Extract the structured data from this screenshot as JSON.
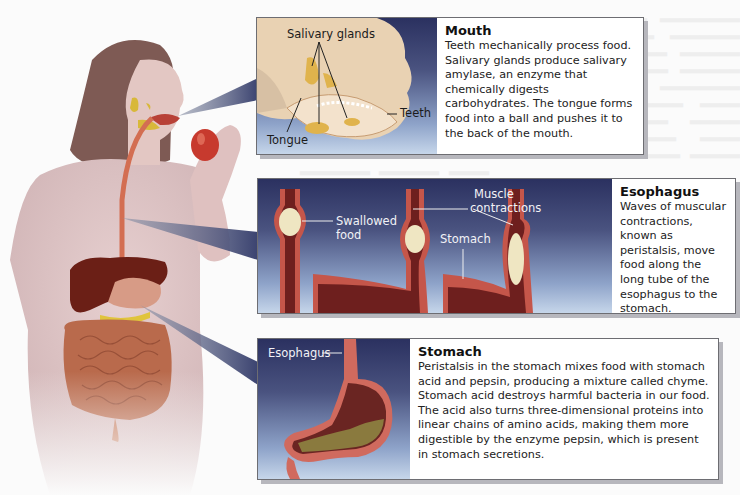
{
  "figure": {
    "colors": {
      "panel_gradient_top": "#2b3160",
      "panel_gradient_bottom": "#c6d6ea",
      "border": "#6d6d72",
      "shadow": "#b7b7bd",
      "tissue": "#c5564a",
      "food": "#efe6c2"
    }
  },
  "panels": {
    "mouth": {
      "title": "Mouth",
      "body": "Teeth mechanically process food. Salivary glands produce salivary amylase, an enzyme that chemically digests carbohydrates. The tongue forms food into a ball and pushes it to the back of the mouth.",
      "labels": {
        "salivary_glands": "Salivary glands",
        "teeth": "Teeth",
        "tongue": "Tongue"
      }
    },
    "esophagus": {
      "title": "Esophagus",
      "body": "Waves of muscular contractions, known as peristalsis, move food along the long tube of the esophagus to the stomach.",
      "labels": {
        "swallowed_food_1": "Swallowed",
        "swallowed_food_2": "food",
        "muscle_1": "Muscle",
        "muscle_2": "contractions",
        "stomach": "Stomach"
      }
    },
    "stomach": {
      "title": "Stomach",
      "body": "Peristalsis in the stomach mixes food with stomach acid and pepsin, producing a mixture called chyme. Stomach acid destroys harmful bacteria in our food. The acid also turns three-dimensional proteins into linear chains of amino acids, making them more digestible by the enzyme pepsin, which is present in stomach secretions.",
      "labels": {
        "esophagus": "Esophagus"
      }
    }
  }
}
